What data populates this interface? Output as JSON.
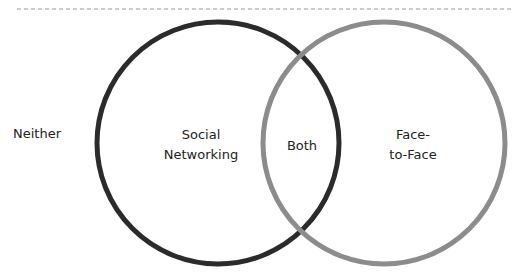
{
  "diagram": {
    "type": "venn",
    "sets": [
      {
        "id": "social",
        "label_lines": [
          "Social",
          "Networking"
        ],
        "stroke_color": "#2b2b2b"
      },
      {
        "id": "face",
        "label_lines": [
          "Face-",
          "to-Face"
        ],
        "stroke_color": "#8c8c8c"
      }
    ],
    "intersection_label": "Both",
    "outside_label": "Neither",
    "divider_color": "#9a9a9a"
  }
}
